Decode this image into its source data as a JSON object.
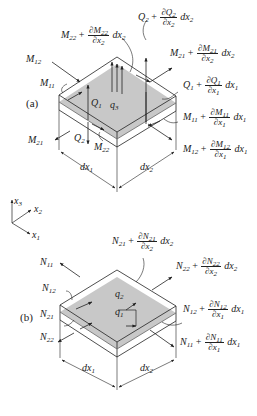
{
  "figure": {
    "panel_a": {
      "tag": "(a)",
      "labels": {
        "M22_plus": {
          "base": "M",
          "sub": "22",
          "op": "+",
          "num": "∂M",
          "num_sub": "22",
          "den": "∂x",
          "den_sub": "2",
          "tail": "dx",
          "tail_sub": "2"
        },
        "Q2_plus": {
          "base": "Q",
          "sub": "2",
          "op": "+",
          "num": "∂Q",
          "num_sub": "2",
          "den": "∂x",
          "den_sub": "2",
          "tail": "dx",
          "tail_sub": "2"
        },
        "M21_plus": {
          "base": "M",
          "sub": "21",
          "op": "+",
          "num": "∂M",
          "num_sub": "21",
          "den": "∂x",
          "den_sub": "2",
          "tail": "dx",
          "tail_sub": "2"
        },
        "Q1_plus": {
          "base": "Q",
          "sub": "1",
          "op": "+",
          "num": "∂Q",
          "num_sub": "1",
          "den": "∂x",
          "den_sub": "1",
          "tail": "dx",
          "tail_sub": "1"
        },
        "M11_plus": {
          "base": "M",
          "sub": "11",
          "op": "+",
          "num": "∂M",
          "num_sub": "11",
          "den": "∂x",
          "den_sub": "1",
          "tail": "dx",
          "tail_sub": "1"
        },
        "M12_plus": {
          "base": "M",
          "sub": "12",
          "op": "+",
          "num": "∂M",
          "num_sub": "12",
          "den": "∂x",
          "den_sub": "1",
          "tail": "dx",
          "tail_sub": "1"
        },
        "M12": {
          "base": "M",
          "sub": "12"
        },
        "M11": {
          "base": "M",
          "sub": "11"
        },
        "M21": {
          "base": "M",
          "sub": "21"
        },
        "M22": {
          "base": "M",
          "sub": "22"
        },
        "Q1": {
          "base": "Q",
          "sub": "1"
        },
        "Q2": {
          "base": "Q",
          "sub": "2"
        },
        "q3": {
          "base": "q",
          "sub": "3"
        },
        "dx1": {
          "base": "dx",
          "sub": "1"
        },
        "dx2": {
          "base": "dx",
          "sub": "2"
        }
      }
    },
    "axes": {
      "x3": {
        "base": "x",
        "sub": "3"
      },
      "x2": {
        "base": "x",
        "sub": "2"
      },
      "x1": {
        "base": "x",
        "sub": "1"
      }
    },
    "panel_b": {
      "tag": "(b)",
      "labels": {
        "N21_plus": {
          "base": "N",
          "sub": "21",
          "op": "+",
          "num": "∂N",
          "num_sub": "21",
          "den": "∂x",
          "den_sub": "2",
          "tail": "dx",
          "tail_sub": "2"
        },
        "N22_plus": {
          "base": "N",
          "sub": "22",
          "op": "+",
          "num": "∂N",
          "num_sub": "22",
          "den": "∂x",
          "den_sub": "2",
          "tail": "dx",
          "tail_sub": "2"
        },
        "N12_plus": {
          "base": "N",
          "sub": "12",
          "op": "+",
          "num": "∂N",
          "num_sub": "12",
          "den": "∂x",
          "den_sub": "1",
          "tail": "dx",
          "tail_sub": "1"
        },
        "N11_plus": {
          "base": "N",
          "sub": "11",
          "op": "+",
          "num": "∂N",
          "num_sub": "11",
          "den": "∂x",
          "den_sub": "1",
          "tail": "dx",
          "tail_sub": "1"
        },
        "N11": {
          "base": "N",
          "sub": "11"
        },
        "N12": {
          "base": "N",
          "sub": "12"
        },
        "N21": {
          "base": "N",
          "sub": "21"
        },
        "N22": {
          "base": "N",
          "sub": "22"
        },
        "q1": {
          "base": "q",
          "sub": "1"
        },
        "q2": {
          "base": "q",
          "sub": "2"
        },
        "dx1": {
          "base": "dx",
          "sub": "1"
        },
        "dx2": {
          "base": "dx",
          "sub": "2"
        }
      }
    },
    "colors": {
      "line": "#222222",
      "fill": "#c8c8c8",
      "background": "#ffffff"
    }
  }
}
